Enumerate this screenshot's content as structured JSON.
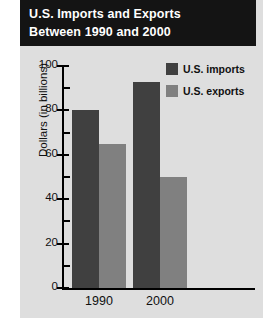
{
  "title": {
    "line1": "U.S. Imports and Exports",
    "line2": "Between 1990 and 2000"
  },
  "colors": {
    "banner_bg": "#141414",
    "panel_bg": "#dedede",
    "imports": "#404040",
    "exports": "#808080",
    "axis": "#000000",
    "title_text": "#ffffff"
  },
  "legend": {
    "position": "top-right",
    "items": [
      {
        "label": "U.S. imports",
        "color": "#404040",
        "swatch_name": "legend-swatch-imports"
      },
      {
        "label": "U.S. exports",
        "color": "#808080",
        "swatch_name": "legend-swatch-exports"
      }
    ]
  },
  "chart_data": {
    "type": "bar",
    "title": "U.S. Imports and Exports Between 1990 and 2000",
    "xlabel": "",
    "ylabel": "Dollars (in billions)",
    "categories": [
      "1990",
      "2000"
    ],
    "series": [
      {
        "name": "U.S. imports",
        "color": "#404040",
        "values": [
          80,
          93
        ]
      },
      {
        "name": "U.S. exports",
        "color": "#808080",
        "values": [
          65,
          50
        ]
      }
    ],
    "ylim": [
      0,
      100
    ],
    "ytick_labels": [
      "0",
      "20",
      "40",
      "60",
      "80",
      "100"
    ],
    "ytick_values": [
      0,
      20,
      40,
      60,
      80,
      100
    ],
    "yminor_values": [
      10,
      30,
      50,
      70,
      90
    ],
    "xtick_labels": [
      "1990",
      "2000"
    ],
    "grid": false,
    "legend_position": "top-right"
  }
}
